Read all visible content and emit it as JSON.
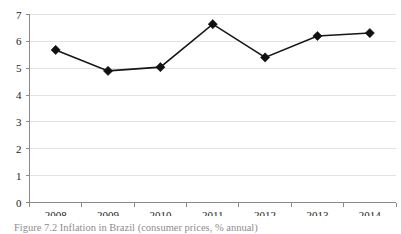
{
  "figure": {
    "caption": "Figure 7.2 Inflation in Brazil (consumer prices, % annual)"
  },
  "chart_data": {
    "type": "line",
    "title": "",
    "xlabel": "",
    "ylabel": "",
    "categories": [
      "2008",
      "2009",
      "2010",
      "2011",
      "2012",
      "2013",
      "2014"
    ],
    "values": [
      5.68,
      4.9,
      5.04,
      6.64,
      5.4,
      6.2,
      6.31
    ],
    "series": [
      {
        "name": "Inflation in Brazil (consumer prices, % annual)",
        "values": [
          5.68,
          4.9,
          5.04,
          6.64,
          5.4,
          6.2,
          6.31
        ]
      }
    ],
    "ylim": [
      0,
      7
    ],
    "yticks": [
      "0",
      "1",
      "2",
      "3",
      "4",
      "5",
      "6",
      "7"
    ],
    "xticks": [
      "2008",
      "2009",
      "2010",
      "2011",
      "2012",
      "2013",
      "2014"
    ],
    "grid": "horizontal",
    "legend": "none",
    "marker": "diamond",
    "line_color": "#161616",
    "marker_color": "#111111",
    "grid_color": "#e3e3e3",
    "axis_color": "#8a8a8a"
  }
}
